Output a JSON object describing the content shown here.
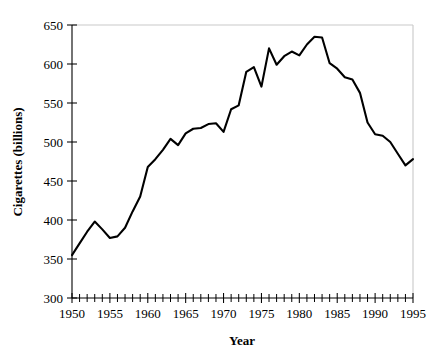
{
  "chart_data": {
    "type": "line",
    "title": "",
    "xlabel": "Year",
    "ylabel": "Cigarettes (billions)",
    "xlim": [
      1950,
      1995
    ],
    "ylim": [
      300,
      650
    ],
    "yticks": [
      300,
      350,
      400,
      450,
      500,
      550,
      600,
      650
    ],
    "xticks": [
      1950,
      1955,
      1960,
      1965,
      1970,
      1975,
      1980,
      1985,
      1990,
      1995
    ],
    "xtick_labels": [
      "1950",
      "1955",
      "1960",
      "1965",
      "1970",
      "1975",
      "1980",
      "1985",
      "1990",
      "1995"
    ],
    "ytick_labels": [
      "300",
      "350",
      "400",
      "450",
      "500",
      "550",
      "600",
      "650"
    ],
    "x_minor_tick_step": 1,
    "grid": false,
    "legend": "none",
    "series_color": "#000000",
    "frame_color": "#c9c9c9",
    "axis_color": "#000000",
    "x": [
      1950,
      1951,
      1952,
      1953,
      1954,
      1955,
      1956,
      1957,
      1958,
      1959,
      1960,
      1961,
      1962,
      1963,
      1964,
      1965,
      1966,
      1967,
      1968,
      1969,
      1970,
      1971,
      1972,
      1973,
      1974,
      1975,
      1976,
      1977,
      1978,
      1979,
      1980,
      1981,
      1982,
      1983,
      1984,
      1985,
      1986,
      1987,
      1988,
      1989,
      1990,
      1991,
      1992,
      1993,
      1994,
      1995
    ],
    "values": [
      355,
      370,
      385,
      398,
      388,
      377,
      379,
      390,
      411,
      430,
      468,
      478,
      490,
      504,
      496,
      511,
      517,
      518,
      523,
      524,
      513,
      542,
      547,
      590,
      596,
      571,
      620,
      599,
      610,
      616,
      611,
      625,
      635,
      634,
      601,
      594,
      583,
      580,
      563,
      525,
      510,
      508,
      500,
      485,
      470,
      478
    ]
  },
  "axis": {
    "x_title": "Year",
    "y_title": "Cigarettes (billions)"
  }
}
